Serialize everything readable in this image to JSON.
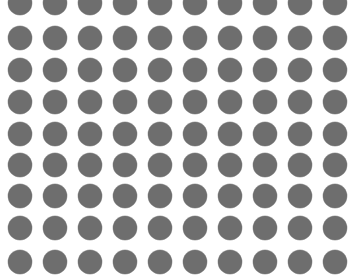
{
  "canvas": {
    "width": 358,
    "height": 279,
    "background_color": "#ffffff"
  },
  "pattern": {
    "type": "dot-grid",
    "shape": "circle",
    "dot_color": "#6e6e6e",
    "dot_diameter": 24,
    "columns": 10,
    "rows": 9,
    "column_centers_x": [
      20,
      55,
      90,
      125,
      160,
      195,
      230,
      265,
      300,
      335
    ],
    "row_centers_y": [
      3,
      38,
      70,
      102,
      134,
      165,
      196,
      228,
      262
    ],
    "total_dots": 90
  }
}
